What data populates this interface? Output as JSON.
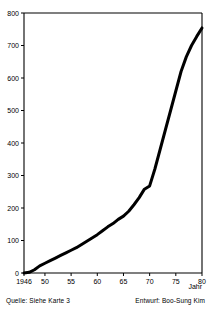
{
  "chart_data": {
    "type": "line",
    "title": "",
    "subtitle": "",
    "xlabel": "Jahr",
    "ylabel": "",
    "xlim": [
      1946,
      1980
    ],
    "ylim": [
      0,
      800
    ],
    "grid": false,
    "legend": null,
    "legend_position": "none",
    "x_tick_labels": [
      "1946",
      "50",
      "55",
      "60",
      "65",
      "70",
      "75",
      "80"
    ],
    "x_tick_values": [
      1946,
      1950,
      1955,
      1960,
      1965,
      1970,
      1975,
      1980
    ],
    "y_tick_labels": [
      "0",
      "100",
      "200",
      "300",
      "400",
      "500",
      "600",
      "700",
      "800"
    ],
    "y_tick_values": [
      0,
      100,
      200,
      300,
      400,
      500,
      600,
      700,
      800
    ],
    "series": [
      {
        "name": "Kumulierte Anzahl",
        "color": "#000000",
        "line_width": 3,
        "x": [
          1946,
          1947,
          1948,
          1949,
          1950,
          1951,
          1952,
          1953,
          1954,
          1955,
          1956,
          1957,
          1958,
          1959,
          1960,
          1961,
          1962,
          1963,
          1964,
          1965,
          1966,
          1967,
          1968,
          1969,
          1970,
          1971,
          1972,
          1973,
          1974,
          1975,
          1976,
          1977,
          1978,
          1979,
          1980
        ],
        "values": [
          0,
          2,
          10,
          22,
          30,
          38,
          46,
          54,
          62,
          70,
          78,
          88,
          98,
          108,
          118,
          130,
          142,
          152,
          165,
          175,
          190,
          210,
          232,
          258,
          268,
          320,
          380,
          440,
          500,
          560,
          620,
          665,
          700,
          728,
          754
        ]
      }
    ],
    "annotations": []
  },
  "axes": {
    "x_axis_title": "Jahr",
    "x_axis_title_name": "x-axis-title",
    "y_axis_title": ""
  },
  "footer": {
    "source": "Quelle: Siehe Karte 3",
    "credit": "Entwurf: Boo-Sung Kim"
  },
  "style": {
    "line_color": "#000000",
    "axis_color": "#000000",
    "background": "#ffffff",
    "text_color": "#000000"
  }
}
